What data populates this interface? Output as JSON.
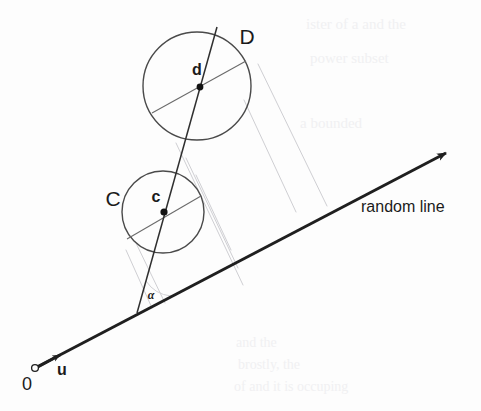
{
  "figure": {
    "canvas": {
      "width": 481,
      "height": 411,
      "background": "#fdfdfd"
    },
    "caption_label": "random line",
    "colors": {
      "ink": "#1b1b1b",
      "stroke_main": "#2a2a2a",
      "stroke_circle": "#4a4a4a",
      "stroke_chord": "#6b6b6b",
      "stroke_faint": "#cfcfd3",
      "paper": "#fdfdfd",
      "ghost": "#efeff1"
    },
    "labels": {
      "circle_big": "D",
      "circle_small": "C",
      "center_big": "d",
      "center_small": "c",
      "angle": "α",
      "origin": "0",
      "direction_vector": "u",
      "random_line": "random line"
    },
    "circles": [
      {
        "name": "D",
        "label": "D",
        "cx": 197,
        "cy": 86,
        "r": 54,
        "center_label": "d"
      },
      {
        "name": "C",
        "label": "C",
        "cx": 163,
        "cy": 212,
        "r": 41,
        "center_label": "c"
      }
    ],
    "points": [
      {
        "name": "origin",
        "label": "0",
        "x": 35,
        "y": 368,
        "marker": "open-circle"
      },
      {
        "name": "center-d",
        "label": "d",
        "x": 200,
        "y": 87,
        "marker": "filled-dot"
      },
      {
        "name": "center-c",
        "label": "c",
        "x": 164,
        "y": 212,
        "marker": "filled-dot"
      },
      {
        "name": "angle-vertex",
        "label": "α",
        "x": 137,
        "y": 313,
        "marker": "none"
      }
    ],
    "lines": {
      "random_line": {
        "from": [
          35,
          368
        ],
        "to": [
          452,
          150
        ],
        "arrow": true,
        "weight": "heavy"
      },
      "direction_u": {
        "from": [
          35,
          368
        ],
        "to": [
          64,
          353
        ],
        "arrow": true,
        "weight": "heavy"
      },
      "center_line": {
        "from": [
          137,
          313
        ],
        "to": [
          217,
          27
        ],
        "arrow": false,
        "weight": "medium"
      },
      "chord_d": {
        "from": [
          152,
          113
        ],
        "to": [
          246,
          61
        ],
        "weight": "light"
      },
      "chord_c": {
        "from": [
          127,
          239
        ],
        "to": [
          201,
          196
        ],
        "weight": "light"
      }
    },
    "projection_lines": [
      {
        "from": [
          258,
          64
        ],
        "to": [
          327,
          206
        ]
      },
      {
        "from": [
          176,
          143
        ],
        "to": [
          243,
          285
        ]
      },
      {
        "from": [
          196,
          175
        ],
        "to": [
          231,
          250
        ]
      },
      {
        "from": [
          135,
          241
        ],
        "to": [
          165,
          303
        ]
      },
      {
        "from": [
          126,
          250
        ],
        "to": [
          152,
          308
        ]
      },
      {
        "from": [
          244,
          100
        ],
        "to": [
          296,
          212
        ]
      }
    ],
    "angle_arc": {
      "cx": 137,
      "cy": 313,
      "r": 34,
      "label": "α",
      "label_x": 151,
      "label_y": 296
    },
    "label_positions": {
      "D": {
        "x": 247,
        "y": 38,
        "size": 21
      },
      "C": {
        "x": 113,
        "y": 200,
        "size": 21
      },
      "d": {
        "x": 197,
        "y": 71,
        "size": 16
      },
      "c": {
        "x": 156,
        "y": 198,
        "size": 16
      },
      "alpha": {
        "x": 151,
        "y": 296,
        "size": 11
      },
      "zero": {
        "x": 27,
        "y": 384,
        "size": 17
      },
      "u": {
        "x": 62,
        "y": 371,
        "size": 16
      },
      "random_line": {
        "x": 361,
        "y": 208,
        "size": 16
      }
    },
    "background_bleed": [
      {
        "x": 306,
        "y": 26,
        "text": "ister of a and the",
        "size": 15
      },
      {
        "x": 310,
        "y": 60,
        "text": "power subset",
        "size": 15
      },
      {
        "x": 300,
        "y": 125,
        "text": "a bounded",
        "size": 15
      },
      {
        "x": 236,
        "y": 344,
        "text": "and the",
        "size": 14
      },
      {
        "x": 238,
        "y": 366,
        "text": "brostly, the",
        "size": 14
      },
      {
        "x": 234,
        "y": 388,
        "text": "of and it is occuping",
        "size": 14
      }
    ]
  }
}
